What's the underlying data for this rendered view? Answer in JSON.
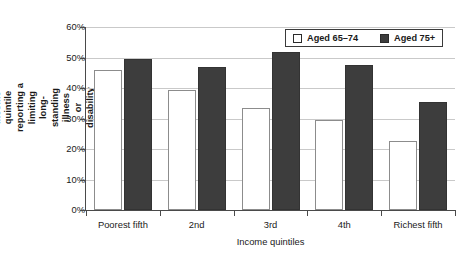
{
  "chart_data": {
    "type": "bar",
    "title": "",
    "categories": [
      "Poorest fifth",
      "2nd",
      "3rd",
      "4th",
      "Richest fifth"
    ],
    "series": [
      {
        "name": "Aged 65–74",
        "values": [
          46.0,
          39.5,
          33.5,
          29.5,
          22.5
        ],
        "color": "#ffffff"
      },
      {
        "name": "Aged 75+",
        "values": [
          49.5,
          46.8,
          51.8,
          47.7,
          35.3
        ],
        "color": "#3d3d3d"
      }
    ],
    "xlabel": "Income quintiles",
    "ylabel": "Proportion in each household income quintile reporting a limiting long-standing illness or disability",
    "ylim": [
      0,
      60
    ],
    "ytick_values": [
      0,
      10,
      20,
      30,
      40,
      50,
      60
    ],
    "ytick_labels": [
      "0%",
      "10%",
      "20%",
      "30%",
      "40%",
      "50%",
      "60%"
    ],
    "grid": true,
    "legend_position": "top-right"
  },
  "axes": {
    "y_title_lines": "Proportion in each household income quintile\nreporting a limiting long-standing illness\nor disability",
    "x_title": "Income quintiles"
  },
  "legend": {
    "entries": [
      {
        "label": "Aged 65–74",
        "swatch": "light"
      },
      {
        "label": "Aged 75+",
        "swatch": "dark"
      }
    ]
  },
  "colors": {
    "bar_light_fill": "#ffffff",
    "bar_light_border": "#8c8c8c",
    "bar_dark_fill": "#3d3d3d",
    "gridline": "#c9c9c9",
    "axis": "#4a4a4a",
    "text": "#1a1a1a",
    "background": "#ffffff"
  }
}
